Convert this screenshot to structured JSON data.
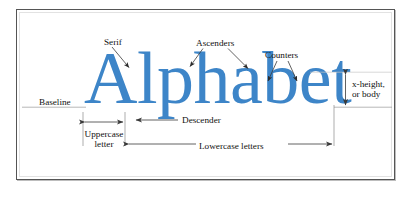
{
  "figure": {
    "wordmark": "Alphabet",
    "wordmark_color": "#3d85c8",
    "background_color": "#ffffff",
    "frame_color": "#555555",
    "rule_color": "#8a8a8a",
    "label_color": "#111111"
  },
  "labels": {
    "serif": "Serif",
    "ascenders": "Ascenders",
    "counters": "Counters",
    "baseline": "Baseline",
    "x_height_line1": "x-height,",
    "x_height_line2": "or body",
    "descender": "Descender",
    "uppercase_line1": "Uppercase",
    "uppercase_line2": "letter",
    "lowercase": "Lowercase letters"
  }
}
